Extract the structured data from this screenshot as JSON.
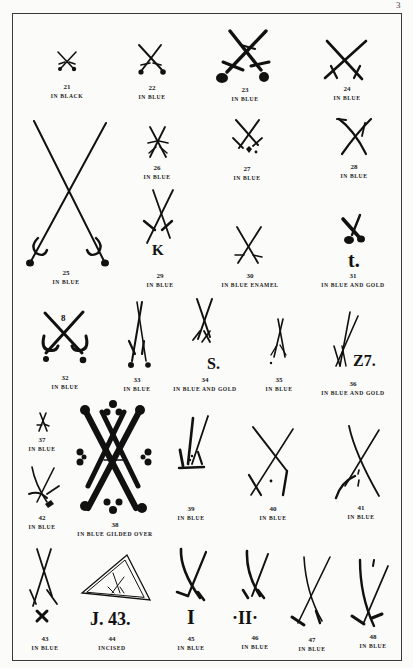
{
  "page": {
    "page_number": "3"
  },
  "marks": [
    {
      "number": "21",
      "caption": "IN BLACK"
    },
    {
      "number": "22",
      "caption": "IN BLUE"
    },
    {
      "number": "23",
      "caption": "IN BLUE"
    },
    {
      "number": "24",
      "caption": "IN BLUE"
    },
    {
      "number": "25",
      "caption": "IN BLUE"
    },
    {
      "number": "26",
      "caption": "IN BLUE"
    },
    {
      "number": "27",
      "caption": "IN BLUE"
    },
    {
      "number": "28",
      "caption": "IN BLUE"
    },
    {
      "number": "29",
      "caption": "IN BLUE",
      "letter": "K"
    },
    {
      "number": "30",
      "caption": "IN BLUE ENAMEL"
    },
    {
      "number": "31",
      "caption": "IN BLUE AND GOLD",
      "letter": "t."
    },
    {
      "number": "32",
      "caption": "IN BLUE"
    },
    {
      "number": "33",
      "caption": "IN BLUE"
    },
    {
      "number": "34",
      "caption": "IN BLUE AND GOLD",
      "letter": "S."
    },
    {
      "number": "35",
      "caption": "IN BLUE"
    },
    {
      "number": "36",
      "caption": "IN BLUE AND GOLD",
      "letter": "Z7."
    },
    {
      "number": "37",
      "caption": "IN BLUE"
    },
    {
      "number": "38",
      "caption": "IN BLUE GILDED OVER"
    },
    {
      "number": "39",
      "caption": "IN BLUE"
    },
    {
      "number": "40",
      "caption": "IN BLUE"
    },
    {
      "number": "41",
      "caption": "IN BLUE"
    },
    {
      "number": "42",
      "caption": "IN BLUE"
    },
    {
      "number": "43",
      "caption": "IN BLUE"
    },
    {
      "number": "44",
      "caption": "INCISED",
      "letter": "J. 43."
    },
    {
      "number": "45",
      "caption": "IN BLUE",
      "letter": "I"
    },
    {
      "number": "46",
      "caption": "IN BLUE",
      "letter": "·II·"
    },
    {
      "number": "47",
      "caption": "IN BLUE"
    },
    {
      "number": "48",
      "caption": "IN BLUE"
    }
  ]
}
